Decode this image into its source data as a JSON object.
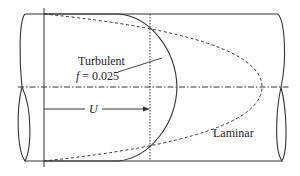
{
  "diagram": {
    "labels": {
      "turbulent": "Turbulent",
      "friction_prefix": "f",
      "friction_value": "= 0.025",
      "velocity": "U",
      "laminar": "Laminar"
    },
    "colors": {
      "stroke": "#333333",
      "text": "#222222",
      "background": "#ffffff"
    }
  }
}
